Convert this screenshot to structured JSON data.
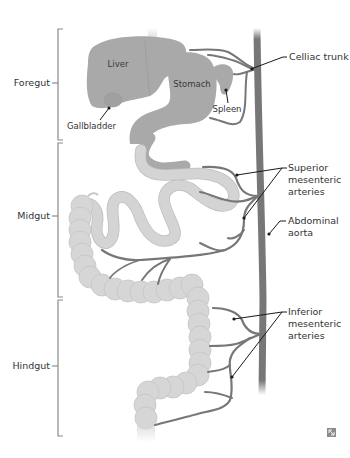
{
  "regions": [
    {
      "id": "foregut",
      "label": "Foregut"
    },
    {
      "id": "midgut",
      "label": "Midgut"
    },
    {
      "id": "hindgut",
      "label": "Hindgut"
    }
  ],
  "organs": {
    "liver": "Liver",
    "stomach": "Stomach",
    "spleen": "Spleen",
    "gallbladder": "Gallbladder"
  },
  "arteries": {
    "celiac": "Celliac trunk",
    "sma_line1": "Superior",
    "sma_line2": "mesenteric",
    "sma_line3": "arteries",
    "aorta_line1": "Abdominal",
    "aorta_line2": "aorta",
    "ima_line1": "Inferior",
    "ima_line2": "mesenteric",
    "ima_line3": "arteries"
  },
  "colors": {
    "foregut_organ": "#a9a9a9",
    "midgut_hindgut": "#d6d6d6",
    "artery": "#777777",
    "bracket": "#8a8a8a",
    "leader": "#1a1a1a"
  },
  "corner_icon": "expand-icon"
}
